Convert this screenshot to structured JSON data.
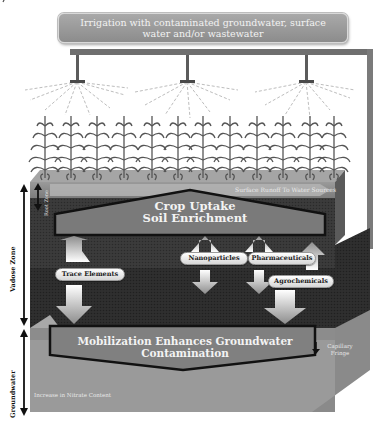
{
  "banner": {
    "text": "Irrigation with contaminated groundwater, surface water and/or wastewater"
  },
  "surface": {
    "runoff_label": "Surface Runoff To Water Sources"
  },
  "zones": {
    "root_zone": "Root Zone",
    "vadose_zone": "Vadose Zone",
    "groundwater": "Groundwater",
    "capillary_fringe_line1": "Capillary",
    "capillary_fringe_line2": "Fringe"
  },
  "boxes": {
    "crop_uptake_line1": "Crop Uptake",
    "crop_uptake_line2": "Soil Enrichment",
    "mobilization_line1": "Mobilization Enhances Groundwater",
    "mobilization_line2": "Contamination"
  },
  "contaminants": [
    {
      "label": "Trace Elements"
    },
    {
      "label": "Nanoparticles"
    },
    {
      "label": "Pharmaceuticals"
    },
    {
      "label": "Agrochemicals"
    }
  ],
  "groundwater_note": "Increase in Nitrate Content",
  "colors": {
    "banner": "#9a9a9a",
    "soil_dark": "#3a3a3a",
    "soil_top": "#8a8a8a",
    "groundwater": "#9a9a9a",
    "box_fill": "#808080",
    "pipe": "#6f6f6f"
  }
}
